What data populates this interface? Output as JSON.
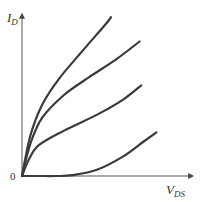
{
  "chart_data": {
    "type": "line",
    "title": "",
    "xlabel": "V",
    "xlabel_sub": "DS",
    "ylabel": "I",
    "ylabel_sub": "D",
    "origin_label": "0",
    "xlim": [
      0,
      1
    ],
    "ylim": [
      0,
      1
    ],
    "grid": false,
    "legend": "none",
    "axis_ticks": "none (qualitative axes, normalized units)",
    "series": [
      {
        "name": "curve-1",
        "x": [
          0,
          0.05,
          0.12,
          0.22,
          0.35,
          0.5,
          0.53
        ],
        "y": [
          0,
          0.25,
          0.44,
          0.6,
          0.76,
          0.94,
          0.98
        ]
      },
      {
        "name": "curve-2",
        "x": [
          0,
          0.05,
          0.12,
          0.25,
          0.4,
          0.56,
          0.7
        ],
        "y": [
          0,
          0.2,
          0.36,
          0.5,
          0.61,
          0.72,
          0.83
        ]
      },
      {
        "name": "curve-3",
        "x": [
          0,
          0.04,
          0.1,
          0.25,
          0.45,
          0.6,
          0.71
        ],
        "y": [
          0,
          0.1,
          0.19,
          0.28,
          0.38,
          0.47,
          0.56
        ]
      },
      {
        "name": "curve-4",
        "x": [
          0,
          0.1,
          0.2,
          0.3,
          0.45,
          0.6,
          0.72,
          0.8
        ],
        "y": [
          0,
          0,
          0,
          0.005,
          0.04,
          0.12,
          0.21,
          0.27
        ]
      }
    ],
    "color": "#3a3a3a"
  }
}
